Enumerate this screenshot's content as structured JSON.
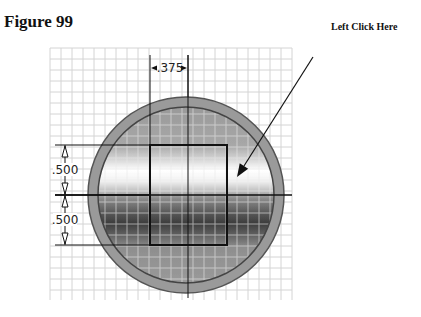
{
  "figure": {
    "title": "Figure 99",
    "callout_label": "Left Click Here"
  },
  "drawing": {
    "grid": {
      "x0": 50,
      "y0": 48,
      "x1": 292,
      "y1": 300,
      "step": 11,
      "color": "#d4d4d4"
    },
    "circle": {
      "cx": 186,
      "cy": 195,
      "r": 98,
      "inner_r": 88,
      "fill": "#9a9a9a",
      "stroke": "#555555"
    },
    "square": {
      "x": 150,
      "y": 145,
      "w": 77,
      "h": 100
    },
    "center_lines": {
      "horizontal_y": 195,
      "vertical_x": 188
    },
    "dimensions": {
      "horizontal": {
        "label": ".375",
        "x1": 150,
        "x2": 188,
        "y": 68
      },
      "vertical": [
        {
          "label": ".500",
          "y1": 145,
          "y2": 195,
          "x": 65
        },
        {
          "label": ".500",
          "y1": 195,
          "y2": 245,
          "x": 65
        }
      ]
    },
    "callout_arrow": {
      "from": [
        313,
        57
      ],
      "to": [
        237,
        177
      ]
    },
    "colors": {
      "line": "#111111",
      "band_light": "#ffffff",
      "band_dark": "#3e3e3e",
      "ring": "#a0a0a0"
    }
  }
}
